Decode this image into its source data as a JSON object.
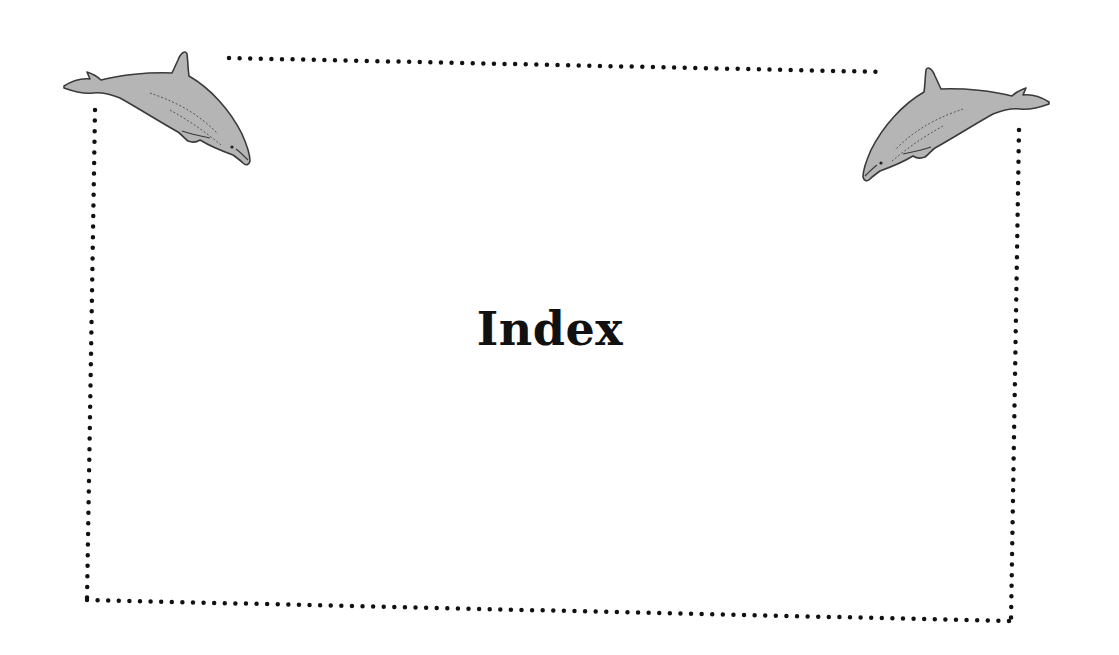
{
  "page": {
    "title": "Index"
  },
  "decorations": {
    "left_icon": "dolphin-icon",
    "right_icon": "dolphin-icon",
    "border_style": "dotted",
    "dot_color": "#111111",
    "dolphin_fill": "#b5b5b5",
    "dolphin_stroke": "#3a3a3a"
  }
}
